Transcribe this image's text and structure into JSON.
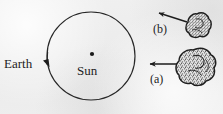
{
  "figure": {
    "background_color": "#eeeeee",
    "ink_color": "#1d1d1d",
    "width": 223,
    "height": 114
  },
  "labels": {
    "earth": "Earth",
    "sun": "Sun",
    "case_a": "(a)",
    "case_b": "(b)"
  },
  "orbit": {
    "name": "earth-orbit-circle",
    "center_x": 91,
    "center_y": 56,
    "radius": 44,
    "stroke_width": 1.2,
    "direction": "clockwise"
  },
  "sun_marker": {
    "name": "sun-dot",
    "x": 92,
    "y": 54,
    "radius": 2.1
  },
  "earth_marker": {
    "name": "earth-direction-arrow",
    "x": 47,
    "y": 62,
    "note": "arrowhead on orbit indicating Earth position and motion"
  },
  "comets": [
    {
      "id": "a",
      "label": "(a)",
      "center_x": 196,
      "center_y": 68,
      "radius": 19,
      "texture": "stippled",
      "arrow": {
        "from_x": 176,
        "from_y": 64,
        "to_x": 149,
        "to_y": 64,
        "direction": "left"
      }
    },
    {
      "id": "b",
      "label": "(b)",
      "center_x": 199,
      "center_y": 26,
      "radius": 14,
      "texture": "stippled",
      "arrow": {
        "from_x": 186,
        "from_y": 21,
        "to_x": 158,
        "to_y": 13,
        "direction": "up-left"
      }
    }
  ]
}
